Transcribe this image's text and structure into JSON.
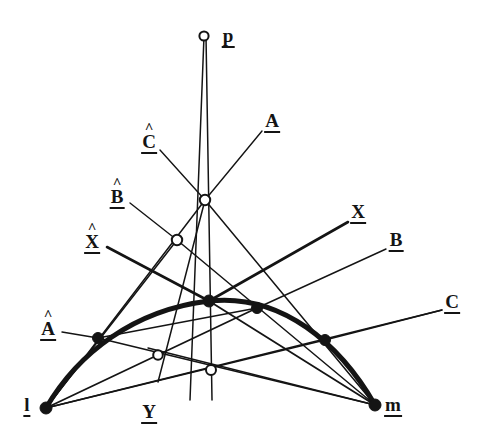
{
  "figure": {
    "background_color": "#ffffff",
    "ink_color": "#141414",
    "width": 496,
    "height": 446
  },
  "labels": {
    "p": {
      "text": "p",
      "hat": "",
      "x": 228,
      "y": 37
    },
    "A": {
      "text": "A",
      "hat": "",
      "x": 272,
      "y": 122
    },
    "C_hat": {
      "text": "C",
      "hat": "^",
      "x": 149,
      "y": 140
    },
    "B_hat": {
      "text": "B",
      "hat": "^",
      "x": 117,
      "y": 195
    },
    "X": {
      "text": "X",
      "hat": "",
      "x": 358,
      "y": 213
    },
    "X_hat": {
      "text": "X",
      "hat": "^",
      "x": 92,
      "y": 240
    },
    "B": {
      "text": "B",
      "hat": "",
      "x": 396,
      "y": 241
    },
    "C": {
      "text": "C",
      "hat": "",
      "x": 452,
      "y": 303
    },
    "A_hat": {
      "text": "A",
      "hat": "^",
      "x": 48,
      "y": 327
    },
    "l": {
      "text": "l",
      "hat": "",
      "x": 27,
      "y": 406
    },
    "Y": {
      "text": "Y",
      "hat": "",
      "x": 149,
      "y": 413
    },
    "m": {
      "text": "m",
      "hat": "",
      "x": 393,
      "y": 406
    }
  },
  "points": {
    "filled": [
      {
        "name": "l",
        "x": 46,
        "y": 408,
        "r": 6.0
      },
      {
        "name": "m",
        "x": 375,
        "y": 405,
        "r": 6.0
      },
      {
        "name": "A-hat-pt",
        "x": 98,
        "y": 338,
        "r": 5.5
      },
      {
        "name": "X-hat-pt",
        "x": 209,
        "y": 301,
        "r": 6.0
      },
      {
        "name": "B-hat-pt",
        "x": 257,
        "y": 308,
        "r": 5.5
      },
      {
        "name": "C-hat-pt",
        "x": 325,
        "y": 340,
        "r": 5.5
      }
    ],
    "open": [
      {
        "name": "p",
        "x": 204,
        "y": 36,
        "r": 4.6
      },
      {
        "name": "O1",
        "x": 205,
        "y": 200,
        "r": 5.2
      },
      {
        "name": "O2",
        "x": 177,
        "y": 240,
        "r": 5.2
      },
      {
        "name": "O3",
        "x": 158,
        "y": 355,
        "r": 4.8
      },
      {
        "name": "Y-pt",
        "x": 211,
        "y": 370,
        "r": 5.0
      }
    ]
  },
  "conic": {
    "description": "thick parabola-like arc through l, A-hat, X-hat, B-hat, C-hat, m",
    "path": "M 46 408 C 78 353 134 310 209 301 C 282 293 340 344 375 405",
    "stroke_width": 5
  },
  "lines": [
    {
      "name": "p-to-l-side",
      "x1": 204,
      "y1": 36,
      "x2": 190,
      "y2": 400,
      "w": 1.5
    },
    {
      "name": "p-vertical",
      "x1": 206,
      "y1": 36,
      "x2": 212,
      "y2": 400,
      "w": 1.5
    },
    {
      "name": "A-leader",
      "x1": 262,
      "y1": 131,
      "x2": 205,
      "y2": 200,
      "w": 1.4
    },
    {
      "name": "C-hat-leader",
      "x1": 160,
      "y1": 150,
      "x2": 205,
      "y2": 200,
      "w": 1.4
    },
    {
      "name": "B-hat-leader",
      "x1": 130,
      "y1": 203,
      "x2": 177,
      "y2": 240,
      "w": 1.4
    },
    {
      "name": "X-hat-leader",
      "x1": 107,
      "y1": 247,
      "x2": 209,
      "y2": 301,
      "w": 2.6
    },
    {
      "name": "A-hat-leader",
      "x1": 62,
      "y1": 332,
      "x2": 98,
      "y2": 338,
      "w": 1.4
    },
    {
      "name": "X-leader",
      "x1": 348,
      "y1": 222,
      "x2": 209,
      "y2": 301,
      "w": 2.6
    },
    {
      "name": "B-leader",
      "x1": 386,
      "y1": 249,
      "x2": 257,
      "y2": 308,
      "w": 1.4
    },
    {
      "name": "C-leader",
      "x1": 442,
      "y1": 310,
      "x2": 325,
      "y2": 340,
      "w": 1.4
    },
    {
      "name": "l-to-O1",
      "x1": 46,
      "y1": 408,
      "x2": 205,
      "y2": 200,
      "w": 1.5
    },
    {
      "name": "l-to-O2",
      "x1": 46,
      "y1": 408,
      "x2": 177,
      "y2": 240,
      "w": 1.5
    },
    {
      "name": "l-to-Bhat-pt",
      "x1": 46,
      "y1": 408,
      "x2": 257,
      "y2": 308,
      "w": 1.8
    },
    {
      "name": "l-to-Chat-pt",
      "x1": 46,
      "y1": 408,
      "x2": 325,
      "y2": 340,
      "w": 1.6
    },
    {
      "name": "l-to-C-label",
      "x1": 46,
      "y1": 408,
      "x2": 442,
      "y2": 310,
      "w": 1.4
    },
    {
      "name": "m-to-O1",
      "x1": 375,
      "y1": 405,
      "x2": 205,
      "y2": 200,
      "w": 1.5
    },
    {
      "name": "m-to-O2",
      "x1": 375,
      "y1": 405,
      "x2": 177,
      "y2": 240,
      "w": 1.5
    },
    {
      "name": "m-to-Xhat-pt",
      "x1": 375,
      "y1": 405,
      "x2": 209,
      "y2": 301,
      "w": 1.8
    },
    {
      "name": "m-to-Ahat-pt",
      "x1": 375,
      "y1": 405,
      "x2": 98,
      "y2": 338,
      "w": 1.6
    },
    {
      "name": "m-to-O3",
      "x1": 375,
      "y1": 405,
      "x2": 148,
      "y2": 348,
      "w": 1.4
    },
    {
      "name": "Chat-down-line",
      "x1": 205,
      "y1": 200,
      "x2": 158,
      "y2": 382,
      "w": 1.5
    },
    {
      "name": "Ahat-to-Bhat",
      "x1": 98,
      "y1": 338,
      "x2": 257,
      "y2": 308,
      "w": 1.5
    }
  ]
}
